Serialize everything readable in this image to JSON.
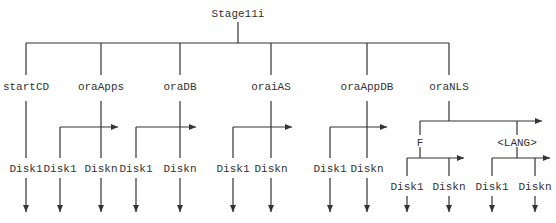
{
  "root": {
    "label": "Stage11i"
  },
  "colors": {
    "line": "#333333",
    "text": "#333333",
    "background": "#ffffff"
  },
  "children": [
    {
      "label": "startCD",
      "disks": [
        "Disk1"
      ]
    },
    {
      "label": "oraApps",
      "disks": [
        "Disk1",
        "Diskn"
      ]
    },
    {
      "label": "oraDB",
      "disks": [
        "Disk1",
        "Diskn"
      ]
    },
    {
      "label": "oraiAS",
      "disks": [
        "Disk1",
        "Diskn"
      ]
    },
    {
      "label": "oraAppDB",
      "disks": [
        "Disk1",
        "Diskn"
      ]
    },
    {
      "label": "oraNLS",
      "subgroups": [
        {
          "label": "F",
          "disks": [
            "Disk1",
            "Diskn"
          ]
        },
        {
          "label": "<LANG>",
          "disks": [
            "Disk1",
            "Diskn"
          ]
        }
      ]
    }
  ]
}
